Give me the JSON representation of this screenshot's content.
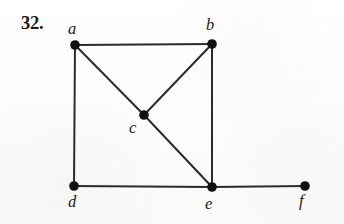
{
  "figure": {
    "problem_number": "32.",
    "caption": "",
    "background_color": "#fdfdfc",
    "edge_color": "#2b2b2b",
    "vertex_color": "#111111",
    "label_color": "#1a1a1a",
    "edge_width": 2,
    "vertex_radius": 4.8,
    "canvas": {
      "width": 344,
      "height": 224
    }
  },
  "graph": {
    "type": "undirected-graph",
    "vertex_count": 6,
    "edge_count": 8,
    "vertices": [
      {
        "id": "a",
        "label": "a",
        "x": 75,
        "y": 45,
        "label_x": 68,
        "label_y": 21,
        "degree": 3
      },
      {
        "id": "b",
        "label": "b",
        "x": 212,
        "y": 44,
        "label_x": 206,
        "label_y": 17,
        "degree": 3
      },
      {
        "id": "c",
        "label": "c",
        "x": 144,
        "y": 115,
        "label_x": 129,
        "label_y": 120,
        "degree": 3
      },
      {
        "id": "d",
        "label": "d",
        "x": 74,
        "y": 186,
        "label_x": 68,
        "label_y": 194,
        "degree": 2
      },
      {
        "id": "e",
        "label": "e",
        "x": 212,
        "y": 187,
        "label_x": 205,
        "label_y": 196,
        "degree": 4
      },
      {
        "id": "f",
        "label": "f",
        "x": 305,
        "y": 186,
        "label_x": 299,
        "label_y": 193,
        "degree": 1
      }
    ],
    "edges": [
      {
        "from": "a",
        "to": "b"
      },
      {
        "from": "a",
        "to": "c"
      },
      {
        "from": "a",
        "to": "d"
      },
      {
        "from": "b",
        "to": "c"
      },
      {
        "from": "b",
        "to": "e"
      },
      {
        "from": "c",
        "to": "e"
      },
      {
        "from": "d",
        "to": "e"
      },
      {
        "from": "e",
        "to": "f"
      }
    ]
  }
}
